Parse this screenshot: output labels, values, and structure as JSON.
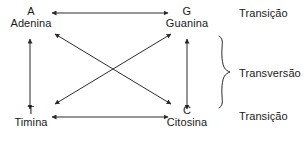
{
  "diagram": {
    "type": "mutation-diagram",
    "stroke_color": "#2b2b2b",
    "text_color": "#1a1a1a",
    "background_color": "#ffffff",
    "nodes": [
      {
        "id": "adenina",
        "symbol": "A",
        "name": "Adenina",
        "position": "top-left"
      },
      {
        "id": "guanina",
        "symbol": "G",
        "name": "Guanina",
        "position": "top-right"
      },
      {
        "id": "timina",
        "symbol": "T",
        "name": "Timina",
        "position": "bottom-left"
      },
      {
        "id": "citosina",
        "symbol": "C",
        "name": "Citosina",
        "position": "bottom-right"
      }
    ],
    "connections": [
      {
        "id": "a-g",
        "from": "A",
        "to": "G",
        "style": "double-arrow",
        "orientation": "horizontal-top",
        "category": "Transição"
      },
      {
        "id": "t-c",
        "from": "T",
        "to": "C",
        "style": "double-arrow",
        "orientation": "horizontal-bottom",
        "category": "Transição"
      },
      {
        "id": "a-t",
        "from": "A",
        "to": "T",
        "style": "double-arrow",
        "orientation": "vertical-left",
        "category": "Transversão"
      },
      {
        "id": "g-c",
        "from": "G",
        "to": "C",
        "style": "double-arrow",
        "orientation": "vertical-right",
        "category": "Transversão"
      },
      {
        "id": "a-c",
        "from": "A",
        "to": "C",
        "style": "double-arrow",
        "orientation": "diagonal",
        "category": "Transversão"
      },
      {
        "id": "g-t",
        "from": "G",
        "to": "T",
        "style": "double-arrow",
        "orientation": "diagonal",
        "category": "Transversão"
      }
    ],
    "side_labels": {
      "transition_top": "Transição",
      "transversion": "Transversão",
      "transition_bottom": "Transição"
    },
    "brace": {
      "label": "Transversão",
      "spans": [
        "vertical-left",
        "vertical-right",
        "diagonal-a-c",
        "diagonal-g-t"
      ]
    }
  }
}
